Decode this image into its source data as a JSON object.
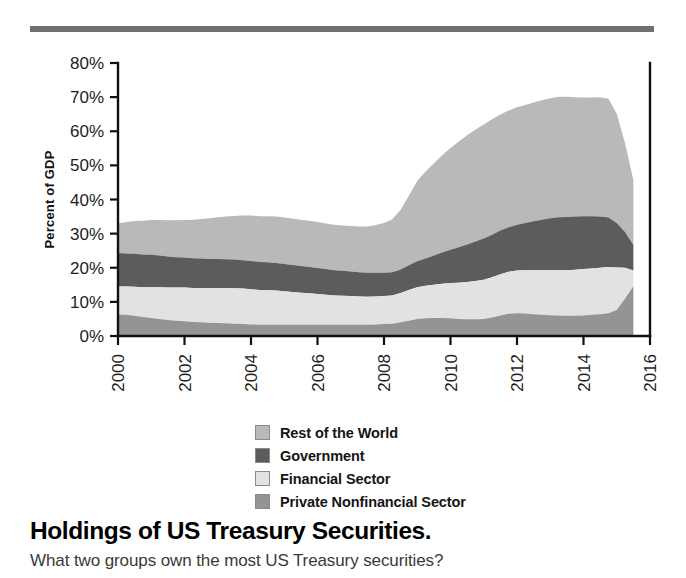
{
  "title": "Holdings of US Treasury Securities.",
  "caption": "What two groups own the most US Treasury securities?",
  "decor": {
    "top_rule_color": "#6f6f6f"
  },
  "legend": {
    "position": "below-plot",
    "items": [
      {
        "label": "Rest of the World",
        "color": "#b9b9b9"
      },
      {
        "label": "Government",
        "color": "#5c5c5c"
      },
      {
        "label": "Financial Sector",
        "color": "#e2e2e2"
      },
      {
        "label": "Private Nonfinancial Sector",
        "color": "#949494"
      }
    ]
  },
  "chart_data": {
    "type": "area",
    "stacked": true,
    "title": "Holdings of US Treasury Securities.",
    "xlabel": "",
    "ylabel": "Percent of GDP",
    "xlim": [
      2000,
      2016
    ],
    "ylim": [
      0,
      80
    ],
    "grid": false,
    "y_tick_labels": [
      "0%",
      "10%",
      "20%",
      "30%",
      "40%",
      "50%",
      "60%",
      "70%",
      "80%"
    ],
    "y_ticks": [
      0,
      10,
      20,
      30,
      40,
      50,
      60,
      70,
      80
    ],
    "x_tick_labels": [
      "2000",
      "2002",
      "2004",
      "2006",
      "2008",
      "2010",
      "2012",
      "2014",
      "2016"
    ],
    "x_ticks": [
      2000,
      2002,
      2004,
      2006,
      2008,
      2010,
      2012,
      2014,
      2016
    ],
    "x": [
      2000,
      2000.25,
      2000.5,
      2000.75,
      2001,
      2001.25,
      2001.5,
      2001.75,
      2002,
      2002.25,
      2002.5,
      2002.75,
      2003,
      2003.25,
      2003.5,
      2003.75,
      2004,
      2004.25,
      2004.5,
      2004.75,
      2005,
      2005.25,
      2005.5,
      2005.75,
      2006,
      2006.25,
      2006.5,
      2006.75,
      2007,
      2007.25,
      2007.5,
      2007.75,
      2008,
      2008.25,
      2008.5,
      2008.75,
      2009,
      2009.25,
      2009.5,
      2009.75,
      2010,
      2010.25,
      2010.5,
      2010.75,
      2011,
      2011.25,
      2011.5,
      2011.75,
      2012,
      2012.25,
      2012.5,
      2012.75,
      2013,
      2013.25,
      2013.5,
      2013.75,
      2014,
      2014.25,
      2014.5,
      2014.75,
      2015,
      2015.25,
      2015.5
    ],
    "series": [
      {
        "name": "Private Nonfinancial Sector",
        "color": "#949494",
        "stack_order": 1,
        "values": [
          6.3,
          6.2,
          5.9,
          5.6,
          5.3,
          5.0,
          4.7,
          4.5,
          4.3,
          4.1,
          4.0,
          3.9,
          3.8,
          3.7,
          3.6,
          3.5,
          3.4,
          3.3,
          3.3,
          3.3,
          3.3,
          3.3,
          3.3,
          3.3,
          3.3,
          3.3,
          3.3,
          3.3,
          3.3,
          3.3,
          3.3,
          3.4,
          3.5,
          3.6,
          4.0,
          4.5,
          5.0,
          5.2,
          5.3,
          5.3,
          5.2,
          5.0,
          4.9,
          4.9,
          5.0,
          5.4,
          6.0,
          6.5,
          6.7,
          6.6,
          6.4,
          6.2,
          6.1,
          6.0,
          5.9,
          5.9,
          6.0,
          6.2,
          6.4,
          6.7,
          7.6,
          11.0,
          14.6
        ]
      },
      {
        "name": "Financial Sector",
        "color": "#e2e2e2",
        "stack_order": 2,
        "values": [
          8.2,
          8.3,
          8.5,
          8.7,
          9.0,
          9.3,
          9.5,
          9.7,
          9.9,
          10.0,
          10.1,
          10.2,
          10.3,
          10.4,
          10.4,
          10.4,
          10.3,
          10.2,
          10.1,
          10.0,
          9.8,
          9.6,
          9.4,
          9.2,
          9.0,
          8.8,
          8.6,
          8.5,
          8.4,
          8.3,
          8.2,
          8.2,
          8.2,
          8.3,
          8.6,
          9.0,
          9.3,
          9.5,
          9.7,
          10.0,
          10.3,
          10.6,
          10.9,
          11.2,
          11.5,
          11.8,
          12.1,
          12.3,
          12.5,
          12.7,
          12.9,
          13.1,
          13.2,
          13.3,
          13.4,
          13.5,
          13.6,
          13.6,
          13.6,
          13.5,
          12.5,
          9.0,
          4.6
        ]
      },
      {
        "name": "Government",
        "color": "#5c5c5c",
        "stack_order": 3,
        "values": [
          9.8,
          9.7,
          9.7,
          9.6,
          9.5,
          9.3,
          9.1,
          8.9,
          8.8,
          8.7,
          8.6,
          8.5,
          8.5,
          8.4,
          8.4,
          8.3,
          8.3,
          8.2,
          8.2,
          8.1,
          8.0,
          7.9,
          7.8,
          7.7,
          7.6,
          7.5,
          7.4,
          7.3,
          7.2,
          7.1,
          7.0,
          6.9,
          6.8,
          6.8,
          6.9,
          7.2,
          7.6,
          8.0,
          8.6,
          9.2,
          9.8,
          10.4,
          11.0,
          11.6,
          12.1,
          12.5,
          12.8,
          13.1,
          13.4,
          13.8,
          14.3,
          14.8,
          15.2,
          15.5,
          15.6,
          15.6,
          15.5,
          15.3,
          15.0,
          14.5,
          13.0,
          10.5,
          7.5
        ]
      },
      {
        "name": "Rest of the World",
        "color": "#b9b9b9",
        "stack_order": 4,
        "values": [
          8.7,
          9.2,
          9.6,
          9.9,
          10.2,
          10.4,
          10.6,
          10.8,
          11.0,
          11.3,
          11.6,
          11.9,
          12.2,
          12.5,
          12.8,
          13.1,
          13.3,
          13.4,
          13.5,
          13.6,
          13.6,
          13.6,
          13.6,
          13.6,
          13.5,
          13.4,
          13.3,
          13.3,
          13.3,
          13.4,
          13.6,
          14.0,
          14.6,
          15.5,
          17.5,
          20.5,
          23.5,
          25.5,
          27.0,
          28.5,
          29.8,
          31.0,
          32.0,
          32.8,
          33.4,
          33.8,
          34.0,
          34.2,
          34.4,
          34.6,
          34.8,
          35.0,
          35.2,
          35.3,
          35.2,
          35.0,
          34.8,
          34.8,
          35.0,
          34.8,
          32.0,
          26.0,
          19.0
        ]
      }
    ],
    "total_peak_percent": 72,
    "total_peak_year": 2013.5
  }
}
